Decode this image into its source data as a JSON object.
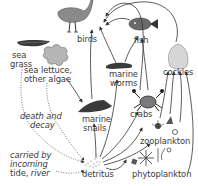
{
  "diagram": {
    "type": "food-web",
    "organisms": {
      "birds": "birds",
      "fish": "fish",
      "marine_worms_line1": "marine",
      "marine_worms_line2": "worms",
      "cockles": "cockles",
      "sea_grass_line1": "sea",
      "sea_grass_line2": "grass",
      "sea_lettuce_line1": "sea lettuce,",
      "sea_lettuce_line2": "other algae",
      "marine_snails_line1": "marine",
      "marine_snails_line2": "snails",
      "crabs": "crabs",
      "zooplankton": "zooplankton",
      "phytoplankton": "phytoplankton",
      "detritus": "detritus"
    },
    "annotations": {
      "death_decay_line1": "death and",
      "death_decay_line2": "decay",
      "carried_line1": "carried by",
      "carried_line2": "incoming",
      "carried_line3_prefix": "tide, ",
      "carried_line3_italic": "river"
    },
    "arrows": [
      {
        "from": "marine worms",
        "to": "birds"
      },
      {
        "from": "fish",
        "to": "birds"
      },
      {
        "from": "cockles",
        "to": "birds"
      },
      {
        "from": "crabs",
        "to": "birds"
      },
      {
        "from": "marine snails",
        "to": "birds"
      },
      {
        "from": "marine worms",
        "to": "fish"
      },
      {
        "from": "crabs",
        "to": "fish"
      },
      {
        "from": "sea lettuce, other algae",
        "to": "marine snails"
      },
      {
        "from": "detritus",
        "to": "marine snails"
      },
      {
        "from": "detritus",
        "to": "marine worms"
      },
      {
        "from": "detritus",
        "to": "crabs"
      },
      {
        "from": "detritus",
        "to": "cockles"
      },
      {
        "from": "detritus",
        "to": "zooplankton"
      },
      {
        "from": "phytoplankton",
        "to": "zooplankton"
      },
      {
        "from": "phytoplankton",
        "to": "cockles"
      },
      {
        "from": "zooplankton",
        "to": "cockles"
      },
      {
        "from": "sea grass",
        "to": "detritus",
        "style": "dotted",
        "label": "death and decay"
      },
      {
        "from": "sea lettuce, other algae",
        "to": "detritus",
        "style": "dotted",
        "label": "death and decay"
      },
      {
        "from": "tide, river",
        "to": "detritus",
        "style": "dotted",
        "label": "carried by incoming tide, river"
      }
    ],
    "colors": {
      "ink": "#333333",
      "bird_fill": "#8a8a8a",
      "algae_fill": "#b5b5b5",
      "cockle_fill": "#d6d6d6",
      "dark_fill": "#3a3a3a"
    }
  }
}
